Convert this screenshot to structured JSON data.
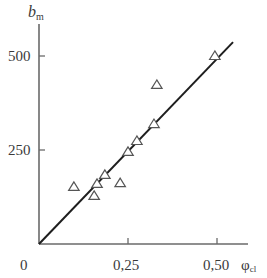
{
  "chart_data": {
    "type": "scatter",
    "title": "",
    "xlabel": "φcl",
    "ylabel": "bm",
    "xlabel_main": "φ",
    "xlabel_sub": "cl",
    "ylabel_main": "b",
    "ylabel_sub": "m",
    "xlim": [
      0,
      0.56
    ],
    "ylim": [
      0,
      560
    ],
    "x_ticks": [
      0.25,
      0.5
    ],
    "x_tick_labels": [
      "0",
      "0,25",
      "0,50"
    ],
    "y_ticks": [
      250,
      500
    ],
    "y_tick_labels": [
      "250",
      "500"
    ],
    "grid": false,
    "legend": null,
    "marker": "open-triangle",
    "series": [
      {
        "name": "measured",
        "type": "scatter",
        "x": [
          0.098,
          0.155,
          0.163,
          0.185,
          0.228,
          0.25,
          0.275,
          0.323,
          0.331,
          0.494
        ],
        "y": [
          152,
          128,
          160,
          184,
          162,
          245,
          274,
          319,
          423,
          500
        ]
      },
      {
        "name": "fit",
        "type": "line",
        "x": [
          0,
          0.545
        ],
        "y": [
          0,
          537
        ]
      }
    ]
  },
  "labels": {
    "origin": "0",
    "x_tick_1": "0,25",
    "x_tick_2": "0,50",
    "y_tick_1": "250",
    "y_tick_2": "500",
    "y_axis_main": "b",
    "y_axis_sub": "m",
    "x_axis_main": "φ",
    "x_axis_sub": "cl"
  },
  "colors": {
    "axis": "#6a6a6a",
    "line": "#1e1e1e",
    "marker": "#555555",
    "text": "#3a3a3a"
  }
}
